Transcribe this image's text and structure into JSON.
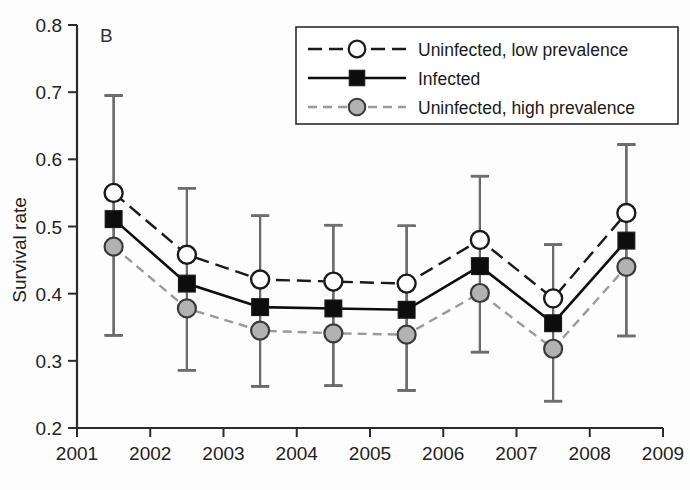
{
  "panel": {
    "label": "B"
  },
  "axes": {
    "ylabel": "Survival rate",
    "xlabel": "",
    "y_ticks": [
      "0.2",
      "0.3",
      "0.4",
      "0.5",
      "0.6",
      "0.7",
      "0.8"
    ],
    "x_ticks": [
      "2001",
      "2002",
      "2003",
      "2004",
      "2005",
      "2006",
      "2007",
      "2008",
      "2009"
    ]
  },
  "legend": {
    "items": [
      {
        "label": "Uninfected, low prevalence",
        "marker": "open-circle-marker",
        "line": "dashed"
      },
      {
        "label": "Infected",
        "marker": "filled-square-marker",
        "line": "solid"
      },
      {
        "label": "Uninfected, high prevalence",
        "marker": "gray-circle-marker",
        "line": "dotted-gray"
      }
    ]
  },
  "colors": {
    "line_dark": "#1a1a1a",
    "line_gray": "#9a9a9a",
    "marker_open_fill": "#ffffff",
    "marker_square_fill": "#0d0d0d",
    "marker_gray_fill": "#b2b2b2",
    "marker_stroke": "#1a1a1a",
    "axis": "#2b2b2b"
  },
  "chart_data": {
    "type": "line",
    "title": "",
    "xlabel": "",
    "ylabel": "Survival rate",
    "xlim": [
      2001,
      2009
    ],
    "ylim": [
      0.2,
      0.8
    ],
    "grid": false,
    "legend_position": "top-right",
    "x": [
      2001.5,
      2002.5,
      2003.5,
      2004.5,
      2005.5,
      2006.5,
      2007.5,
      2008.5
    ],
    "xtick_values": [
      2001,
      2002,
      2003,
      2004,
      2005,
      2006,
      2007,
      2008,
      2009
    ],
    "ytick_values": [
      0.2,
      0.3,
      0.4,
      0.5,
      0.6,
      0.7,
      0.8
    ],
    "series": [
      {
        "name": "Uninfected, low prevalence",
        "marker": "open-circle",
        "linestyle": "dashed",
        "color": "#1a1a1a",
        "values": [
          0.55,
          0.458,
          0.421,
          0.418,
          0.415,
          0.48,
          0.393,
          0.52
        ],
        "err_low": [
          0.338,
          0.286,
          0.262,
          0.263,
          0.256,
          0.313,
          0.24,
          0.337
        ],
        "err_high": [
          0.695,
          0.557,
          0.516,
          0.502,
          0.501,
          0.575,
          0.473,
          0.622
        ]
      },
      {
        "name": "Infected",
        "marker": "filled-square",
        "linestyle": "solid",
        "color": "#0d0d0d",
        "values": [
          0.511,
          0.415,
          0.38,
          0.378,
          0.376,
          0.441,
          0.356,
          0.479
        ],
        "err_low": [
          null,
          null,
          null,
          null,
          null,
          null,
          null,
          null
        ],
        "err_high": [
          null,
          null,
          null,
          null,
          null,
          null,
          null,
          null
        ]
      },
      {
        "name": "Uninfected, high prevalence",
        "marker": "gray-circle",
        "linestyle": "dotted",
        "color": "#9a9a9a",
        "values": [
          0.47,
          0.378,
          0.345,
          0.341,
          0.339,
          0.401,
          0.318,
          0.44
        ],
        "err_low": [
          0.338,
          0.286,
          0.262,
          0.263,
          0.256,
          0.313,
          0.24,
          0.337
        ],
        "err_high": [
          0.695,
          0.557,
          0.516,
          0.502,
          0.501,
          0.575,
          0.473,
          0.622
        ]
      }
    ]
  }
}
